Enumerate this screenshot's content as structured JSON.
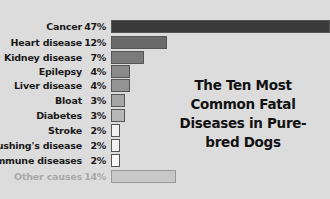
{
  "chart_data": {
    "type": "bar",
    "orientation": "horizontal",
    "title": "The Ten Most Common Fatal Diseases in Pure-bred Dogs",
    "categories": [
      "Cancer",
      "Heart disease",
      "Kidney disease",
      "Epilepsy",
      "Liver disease",
      "Bloat",
      "Diabetes",
      "Stroke",
      "Cushing's disease",
      "Immune diseases",
      "Other causes"
    ],
    "values": [
      47,
      12,
      7,
      4,
      4,
      3,
      3,
      2,
      2,
      2,
      14
    ],
    "value_labels": [
      "47%",
      "12%",
      "7%",
      "4%",
      "4%",
      "3%",
      "3%",
      "2%",
      "2%",
      "2%",
      "14%"
    ],
    "unit": "%",
    "xlabel": "",
    "ylabel": "",
    "grid": false,
    "legend": "none",
    "colors": [
      "#3a3a3a",
      "#6a6a6a",
      "#7a7a7a",
      "#8a8a8a",
      "#939393",
      "#a6a6a6",
      "#b8b8b8",
      "#f2f2f2",
      "#f2f2f2",
      "#fafafa",
      "#c8c8c8"
    ]
  },
  "rows": [
    {
      "label": "Cancer",
      "pct": "47%"
    },
    {
      "label": "Heart disease",
      "pct": "12%"
    },
    {
      "label": "Kidney disease",
      "pct": "7%"
    },
    {
      "label": "Epilepsy",
      "pct": "4%"
    },
    {
      "label": "Liver disease",
      "pct": "4%"
    },
    {
      "label": "Bloat",
      "pct": "3%"
    },
    {
      "label": "Diabetes",
      "pct": "3%"
    },
    {
      "label": "Stroke",
      "pct": "2%"
    },
    {
      "label": "Cushing's disease",
      "pct": "2%"
    },
    {
      "label": "Immune diseases",
      "pct": "2%"
    },
    {
      "label": "Other causes",
      "pct": "14%"
    }
  ],
  "title": "The Ten Most Common Fatal Diseases in Pure-bred Dogs"
}
